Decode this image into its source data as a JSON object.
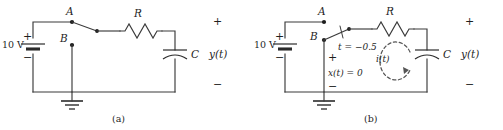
{
  "figure": {
    "kind": "circuit-diagram",
    "panel_count": 2,
    "colors": {
      "wire": "#3a3a3a",
      "text": "#1f1f1f",
      "annotation": "#555555",
      "background": "#ffffff"
    }
  },
  "panel_a": {
    "caption": "(a)",
    "source": {
      "label": "10 V",
      "plus": "+",
      "minus": "−"
    },
    "nodes": {
      "a": "A",
      "b": "B"
    },
    "resistor": {
      "label": "R"
    },
    "capacitor": {
      "label": "C"
    },
    "output": {
      "plus": "+",
      "label": "y(t)",
      "minus": "−"
    },
    "switch": {
      "state": "open",
      "thrown_to": "none"
    },
    "ground": {
      "name": "ground-symbol"
    }
  },
  "panel_b": {
    "caption": "(b)",
    "source": {
      "label": "10 V",
      "plus": "+",
      "minus": "−"
    },
    "nodes": {
      "a": "A",
      "b": "B"
    },
    "resistor": {
      "label": "R"
    },
    "capacitor": {
      "label": "C"
    },
    "output": {
      "plus": "+",
      "label": "y(t)",
      "minus": "−"
    },
    "switch": {
      "state": "closed",
      "thrown_to": "B",
      "time_label": "t = −0.5"
    },
    "input_branch": {
      "plus": "+",
      "label": "x(t) = 0",
      "minus": "−"
    },
    "current": {
      "label": "i(t)",
      "direction": "clockwise"
    },
    "ground": {
      "name": "ground-symbol"
    }
  }
}
